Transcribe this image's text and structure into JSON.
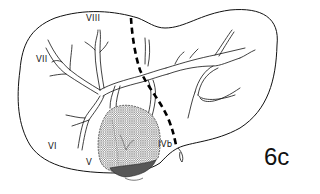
{
  "figure": {
    "label": "6c"
  },
  "segments": [
    {
      "id": "VIII",
      "label": "VIII",
      "x": 86,
      "y": 13
    },
    {
      "id": "VII",
      "label": "VII",
      "x": 36,
      "y": 54
    },
    {
      "id": "VI",
      "label": "VI",
      "x": 48,
      "y": 141
    },
    {
      "id": "V",
      "label": "V",
      "x": 86,
      "y": 157
    },
    {
      "id": "IVb",
      "label": "IVb",
      "x": 158,
      "y": 139
    }
  ],
  "colors": {
    "outline": "#111111",
    "dashed_line": "#000000",
    "hatch": "#555555",
    "dark_hatch": "#3a3a3a",
    "background": "#ffffff"
  }
}
